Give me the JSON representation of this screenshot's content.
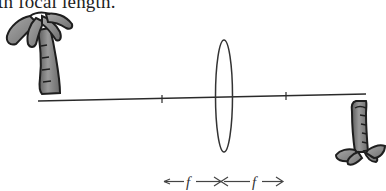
{
  "header": {
    "cropped_text": "th focal length."
  },
  "diagram": {
    "type": "thin-lens-ray-diagram",
    "objects": [
      {
        "name": "object",
        "icon": "palm-tree-icon",
        "orientation": "upright",
        "side": "left"
      },
      {
        "name": "image",
        "icon": "palm-tree-icon",
        "orientation": "inverted",
        "side": "right"
      }
    ],
    "lens": "converging-lens",
    "focal_marks": [
      "left-focal-point",
      "right-focal-point"
    ],
    "labels": {
      "left_focal": "f",
      "right_focal": "f"
    },
    "colors": {
      "line": "#2a2a2a",
      "tree_fill": "#8a8a8a",
      "tree_outline": "#1e1e1e"
    }
  }
}
